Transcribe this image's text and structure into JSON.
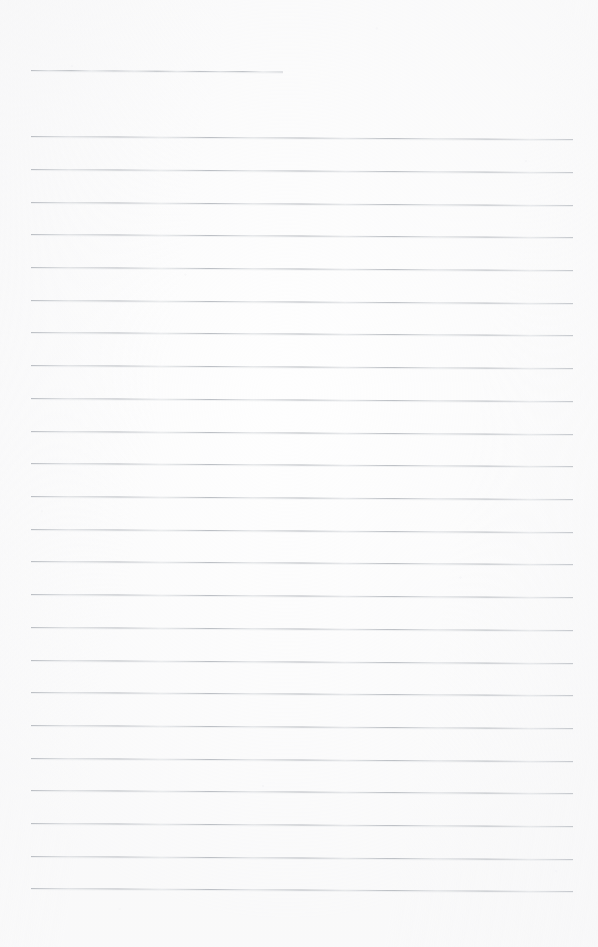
{
  "document": {
    "kind": "scanned-ruled-notebook-page",
    "title": "Blank lined page",
    "page_width": 598,
    "page_height": 947,
    "background_color": "#fefefe",
    "rule_color": "#b0b4ba",
    "rule_thickness_px": 1,
    "rule_spacing_px": 32.8,
    "rule_count": 25,
    "skew_degrees": 0.32,
    "text_content": "",
    "handwriting_present": false,
    "margin_left_px": 31,
    "margin_right_px": 573
  },
  "rules": [
    {
      "index": 1,
      "x": 31,
      "y": 70,
      "width": 252,
      "kind": "short-header-rule"
    },
    {
      "index": 2,
      "x": 31,
      "y": 136,
      "width": 542,
      "kind": "full-rule"
    },
    {
      "index": 3,
      "x": 31,
      "y": 169,
      "width": 542,
      "kind": "full-rule"
    },
    {
      "index": 4,
      "x": 31,
      "y": 202,
      "width": 542,
      "kind": "full-rule"
    },
    {
      "index": 5,
      "x": 31,
      "y": 234,
      "width": 542,
      "kind": "full-rule"
    },
    {
      "index": 6,
      "x": 31,
      "y": 267,
      "width": 542,
      "kind": "full-rule"
    },
    {
      "index": 7,
      "x": 31,
      "y": 300,
      "width": 542,
      "kind": "full-rule"
    },
    {
      "index": 8,
      "x": 31,
      "y": 332,
      "width": 542,
      "kind": "full-rule"
    },
    {
      "index": 9,
      "x": 31,
      "y": 365,
      "width": 542,
      "kind": "full-rule"
    },
    {
      "index": 10,
      "x": 31,
      "y": 398,
      "width": 542,
      "kind": "full-rule"
    },
    {
      "index": 11,
      "x": 31,
      "y": 431,
      "width": 542,
      "kind": "full-rule"
    },
    {
      "index": 12,
      "x": 31,
      "y": 463,
      "width": 542,
      "kind": "full-rule"
    },
    {
      "index": 13,
      "x": 31,
      "y": 496,
      "width": 542,
      "kind": "full-rule"
    },
    {
      "index": 14,
      "x": 31,
      "y": 529,
      "width": 542,
      "kind": "full-rule"
    },
    {
      "index": 15,
      "x": 31,
      "y": 561,
      "width": 542,
      "kind": "full-rule"
    },
    {
      "index": 16,
      "x": 31,
      "y": 594,
      "width": 542,
      "kind": "full-rule"
    },
    {
      "index": 17,
      "x": 31,
      "y": 627,
      "width": 542,
      "kind": "full-rule"
    },
    {
      "index": 18,
      "x": 31,
      "y": 660,
      "width": 542,
      "kind": "full-rule"
    },
    {
      "index": 19,
      "x": 31,
      "y": 692,
      "width": 542,
      "kind": "full-rule"
    },
    {
      "index": 20,
      "x": 31,
      "y": 725,
      "width": 542,
      "kind": "full-rule"
    },
    {
      "index": 21,
      "x": 31,
      "y": 758,
      "width": 542,
      "kind": "full-rule"
    },
    {
      "index": 22,
      "x": 31,
      "y": 790,
      "width": 542,
      "kind": "full-rule"
    },
    {
      "index": 23,
      "x": 31,
      "y": 823,
      "width": 542,
      "kind": "full-rule"
    },
    {
      "index": 24,
      "x": 31,
      "y": 856,
      "width": 542,
      "kind": "full-rule"
    },
    {
      "index": 25,
      "x": 31,
      "y": 888,
      "width": 542,
      "kind": "full-rule"
    }
  ]
}
